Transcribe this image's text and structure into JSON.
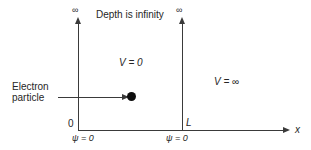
{
  "diagram": {
    "top_note": "Depth is infinity",
    "infinity_symbol_left": "∞",
    "infinity_symbol_right": "∞",
    "potential_inside": "V = 0",
    "potential_outside": "V = ∞",
    "origin_label": "0",
    "well_width_label": "L",
    "x_axis_label": "x",
    "boundary_condition_left": "ψ = 0",
    "boundary_condition_right": "ψ = 0",
    "particle_label_line1": "Electron",
    "particle_label_line2": "particle",
    "line_color": "#3a3a3a",
    "text_color": "#262626",
    "particle_color": "#0d0d0d",
    "background_color": "#ffffff"
  }
}
